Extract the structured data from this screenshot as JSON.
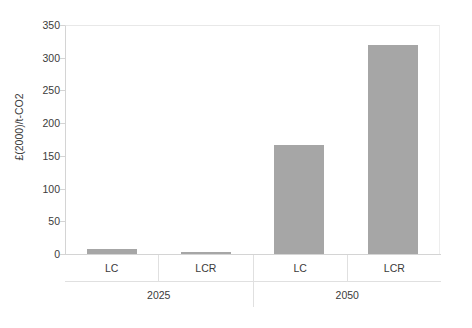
{
  "chart_data": {
    "type": "bar",
    "title": "",
    "xlabel": "",
    "ylabel": "£(2000)/t-CO2",
    "ylim": [
      0,
      350
    ],
    "ytick_labels": [
      "350",
      "300",
      "250",
      "200",
      "150",
      "100",
      "50",
      "0"
    ],
    "ytick_values": [
      350,
      300,
      250,
      200,
      150,
      100,
      50,
      0
    ],
    "grid": false,
    "legend": "none",
    "categories": [
      "LC",
      "LCR",
      "LC",
      "LCR"
    ],
    "groups": [
      {
        "label": "2025",
        "span": 2
      },
      {
        "label": "2050",
        "span": 2
      }
    ],
    "values": [
      8,
      3,
      167,
      320
    ],
    "bars": [
      {
        "group": "2025",
        "category": "LC",
        "value": 8
      },
      {
        "group": "2025",
        "category": "LCR",
        "value": 3
      },
      {
        "group": "2050",
        "category": "LC",
        "value": 167
      },
      {
        "group": "2050",
        "category": "LCR",
        "value": 320
      }
    ],
    "series": [
      {
        "name": "",
        "values": [
          8,
          3,
          167,
          320
        ]
      }
    ],
    "colors": {
      "bar_fill": "#a6a6a6",
      "axis_line": "#d4d4d4",
      "text": "#3b3b3b",
      "background": "#ffffff"
    }
  }
}
